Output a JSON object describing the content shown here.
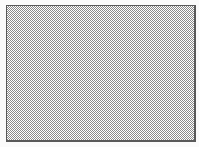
{
  "panel": {
    "fill_pattern": "dither-checkerboard",
    "fill_colors": [
      "#8a8a8a",
      "#ffffff"
    ],
    "border_color": "#5a5a5a"
  },
  "background_color": "#ffffff"
}
